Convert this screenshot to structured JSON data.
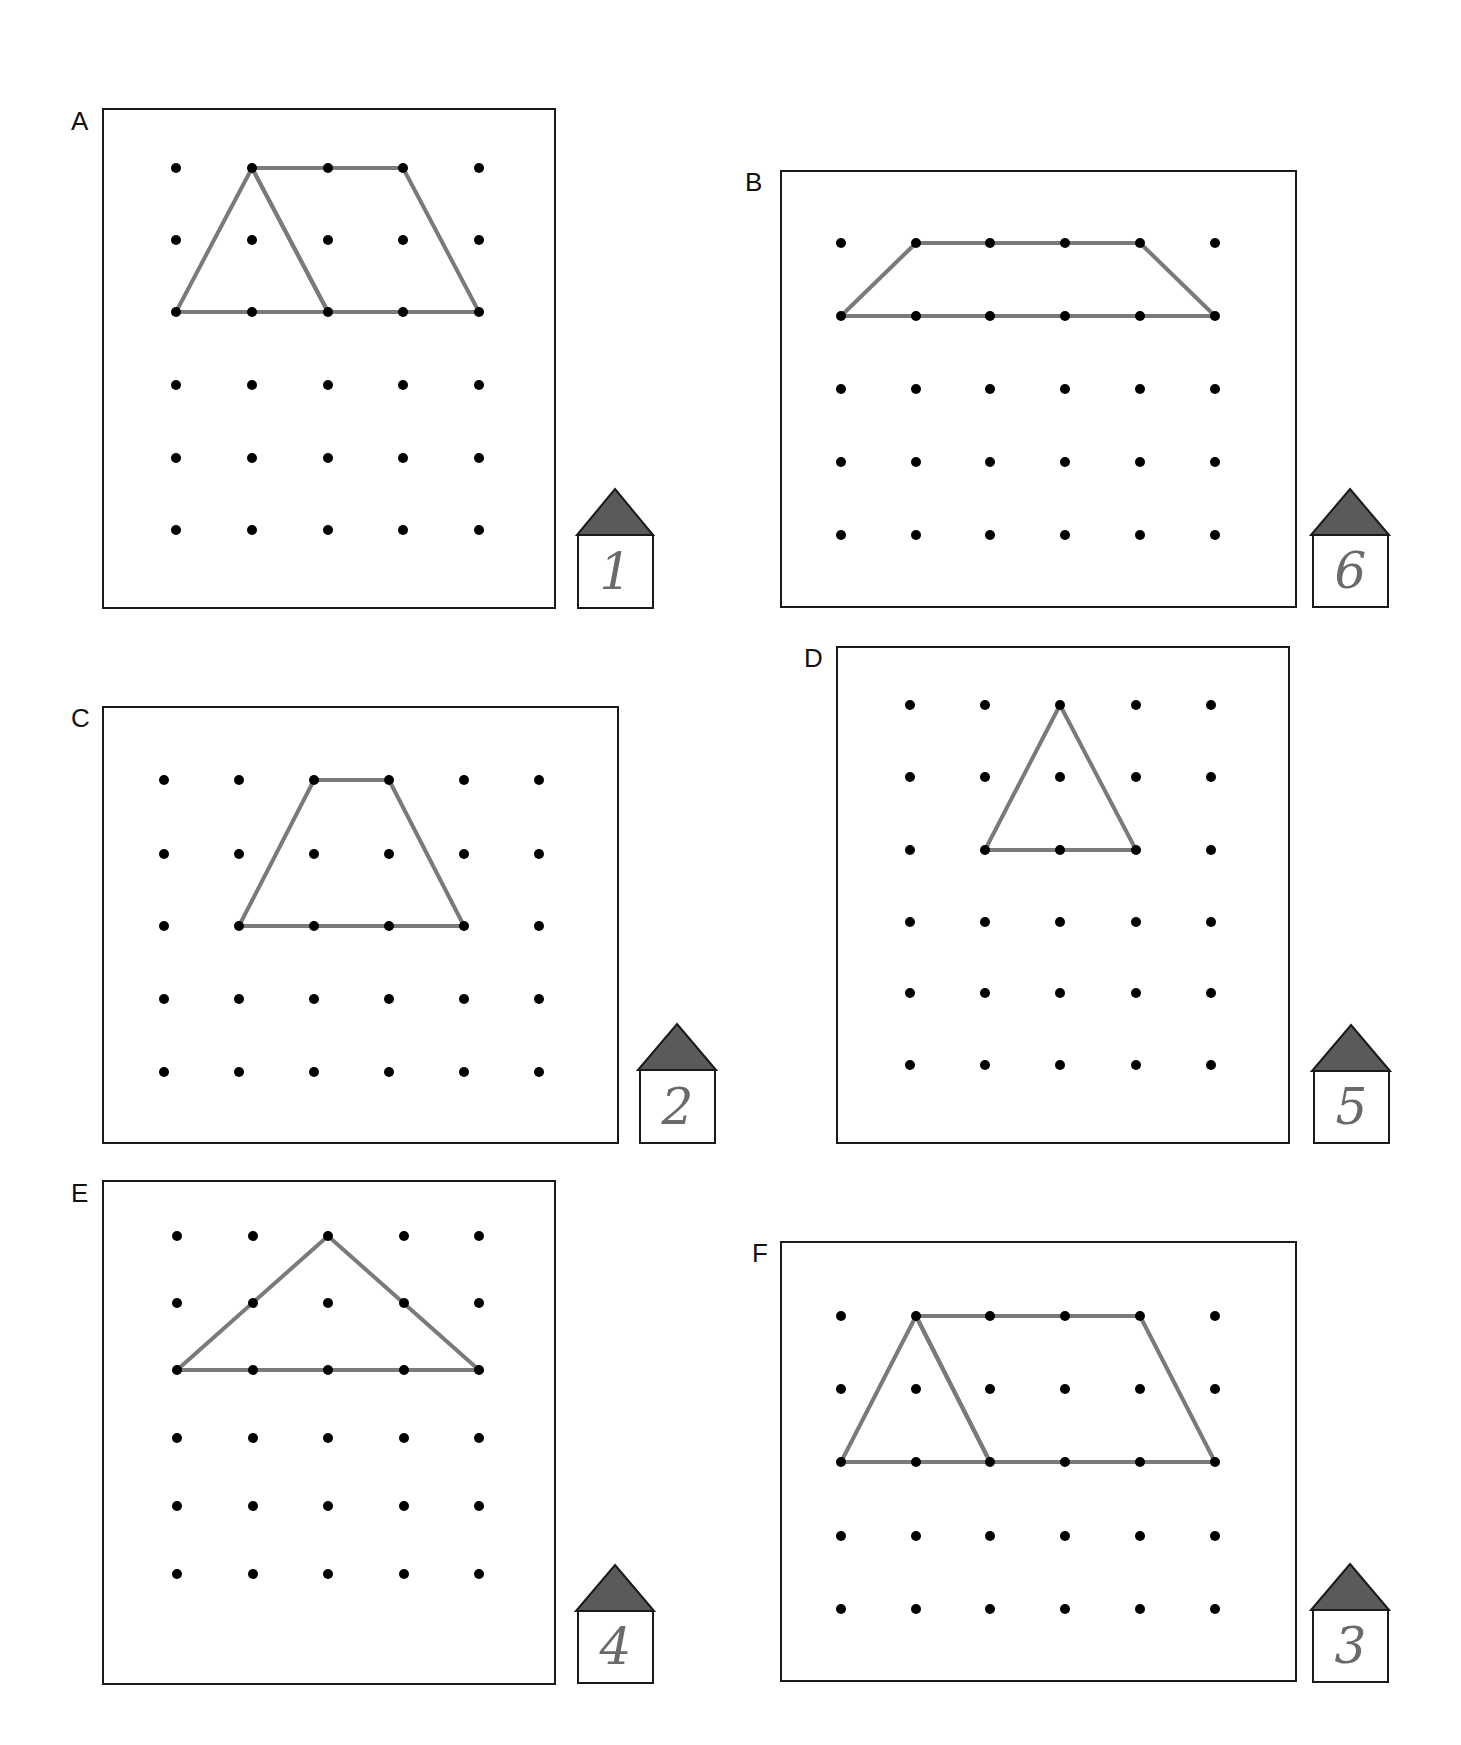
{
  "colors": {
    "dot": "#000000",
    "line": "#7a7a7a",
    "roof": "#5a5a5a",
    "border": "#1a1a1a",
    "handwriting": "#6a6a6a"
  },
  "panels": [
    {
      "label": "A",
      "house_number": "1",
      "box": [
        102,
        108,
        555,
        608
      ],
      "grid": {
        "xs": [
          176,
          252,
          328,
          403,
          479
        ],
        "ys": [
          168,
          240,
          312,
          385,
          458,
          530
        ]
      },
      "shapes": [
        {
          "type": "triangle",
          "points": [
            [
              176,
              312
            ],
            [
              252,
              168
            ],
            [
              328,
              312
            ]
          ]
        },
        {
          "type": "parallelogram",
          "points": [
            [
              252,
              168
            ],
            [
              403,
              168
            ],
            [
              479,
              312
            ],
            [
              328,
              312
            ]
          ]
        }
      ],
      "house": [
        575,
        487,
        652,
        608
      ]
    },
    {
      "label": "B",
      "house_number": "6",
      "box": [
        780,
        170,
        1296,
        607
      ],
      "grid": {
        "xs": [
          841,
          916,
          990,
          1065,
          1140,
          1215
        ],
        "ys": [
          243,
          316,
          389,
          462,
          535
        ]
      },
      "shapes": [
        {
          "type": "trapezoid",
          "points": [
            [
              916,
              243
            ],
            [
              1140,
              243
            ],
            [
              1215,
              316
            ],
            [
              841,
              316
            ]
          ]
        }
      ],
      "house": [
        1311,
        487,
        1389,
        607
      ]
    },
    {
      "label": "C",
      "house_number": "2",
      "box": [
        102,
        706,
        618,
        1143
      ],
      "grid": {
        "xs": [
          164,
          239,
          314,
          389,
          464,
          539
        ],
        "ys": [
          780,
          854,
          926,
          999,
          1072
        ]
      },
      "shapes": [
        {
          "type": "trapezoid",
          "points": [
            [
              314,
              780
            ],
            [
              389,
              780
            ],
            [
              464,
              926
            ],
            [
              239,
              926
            ]
          ]
        }
      ],
      "house": [
        638,
        1022,
        715,
        1143
      ]
    },
    {
      "label": "D",
      "house_number": "5",
      "box": [
        836,
        646,
        1289,
        1143
      ],
      "grid": {
        "xs": [
          910,
          985,
          1060,
          1136,
          1211
        ],
        "ys": [
          705,
          777,
          850,
          922,
          993,
          1065
        ]
      },
      "shapes": [
        {
          "type": "triangle",
          "points": [
            [
              1060,
              705
            ],
            [
              985,
              850
            ],
            [
              1136,
              850
            ]
          ]
        }
      ],
      "house": [
        1312,
        1023,
        1389,
        1143
      ]
    },
    {
      "label": "E",
      "house_number": "4",
      "box": [
        102,
        1180,
        555,
        1684
      ],
      "grid": {
        "xs": [
          177,
          253,
          328,
          404,
          479
        ],
        "ys": [
          1236,
          1303,
          1370,
          1438,
          1506,
          1574
        ]
      },
      "shapes": [
        {
          "type": "triangle",
          "points": [
            [
              328,
              1236
            ],
            [
              177,
              1370
            ],
            [
              479,
              1370
            ]
          ]
        }
      ],
      "house": [
        576,
        1563,
        653,
        1683
      ]
    },
    {
      "label": "F",
      "house_number": "3",
      "box": [
        780,
        1241,
        1296,
        1681
      ],
      "grid": {
        "xs": [
          841,
          916,
          990,
          1065,
          1140,
          1215
        ],
        "ys": [
          1316,
          1389,
          1462,
          1536,
          1609
        ]
      },
      "shapes": [
        {
          "type": "triangle",
          "points": [
            [
              841,
              1462
            ],
            [
              916,
              1316
            ],
            [
              990,
              1462
            ]
          ]
        },
        {
          "type": "parallelogram",
          "points": [
            [
              916,
              1316
            ],
            [
              1140,
              1316
            ],
            [
              1215,
              1462
            ],
            [
              990,
              1462
            ]
          ]
        }
      ],
      "house": [
        1311,
        1562,
        1389,
        1682
      ]
    }
  ]
}
